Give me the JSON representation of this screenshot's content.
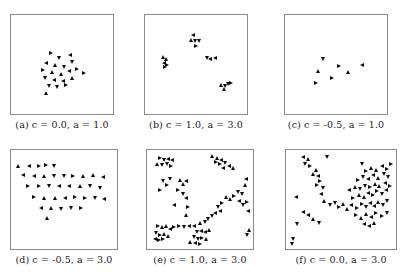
{
  "figure": {
    "marker_color": "#0b0b0b",
    "frame_color": "#8a8a8a",
    "background": "#ffffff",
    "rows": 2,
    "cols": 3
  },
  "panels": [
    {
      "tag": "(a)",
      "caption": "(a) c = 0.0, a = 1.0",
      "c": "0.0",
      "a": "1.0",
      "n_points": 21
    },
    {
      "tag": "(b)",
      "caption": "(b) c = 1.0, a = 3.0",
      "c": "1.0",
      "a": "3.0",
      "n_points": 18
    },
    {
      "tag": "(c)",
      "caption": "(c) c = -0.5, a = 1.0",
      "c": "-0.5",
      "a": "1.0",
      "n_points": 7
    },
    {
      "tag": "(d)",
      "caption": "(d) c = -0.5, a = 3.0",
      "c": "-0.5",
      "a": "3.0",
      "n_points": 43
    },
    {
      "tag": "(e)",
      "caption": "(e) c = 1.0, a = 3.0",
      "c": "1.0",
      "a": "3.0",
      "n_points": 78
    },
    {
      "tag": "(f)",
      "caption": "(f) c = 0.0, a = 3.0",
      "c": "0.0",
      "a": "3.0",
      "n_points": 76
    }
  ],
  "chart_data": [
    {
      "type": "scatter",
      "title": "(a) c = 0.0, a = 1.0",
      "xlabel": "",
      "ylabel": "",
      "xlim": [
        0,
        1
      ],
      "ylim": [
        0,
        1
      ],
      "grid": false,
      "legend": false,
      "marker": "triangle",
      "points": [
        [
          0.39,
          0.62
        ],
        [
          0.47,
          0.57
        ],
        [
          0.58,
          0.6
        ],
        [
          0.33,
          0.52
        ],
        [
          0.43,
          0.5
        ],
        [
          0.52,
          0.47
        ],
        [
          0.6,
          0.53
        ],
        [
          0.3,
          0.44
        ],
        [
          0.4,
          0.42
        ],
        [
          0.49,
          0.4
        ],
        [
          0.57,
          0.43
        ],
        [
          0.66,
          0.45
        ],
        [
          0.73,
          0.41
        ],
        [
          0.32,
          0.35
        ],
        [
          0.42,
          0.33
        ],
        [
          0.51,
          0.32
        ],
        [
          0.6,
          0.35
        ],
        [
          0.36,
          0.27
        ],
        [
          0.45,
          0.26
        ],
        [
          0.54,
          0.28
        ],
        [
          0.33,
          0.19
        ]
      ]
    },
    {
      "type": "scatter",
      "title": "(b) c = 1.0, a = 3.0",
      "xlabel": "",
      "ylabel": "",
      "xlim": [
        0,
        1
      ],
      "ylim": [
        0,
        1
      ],
      "grid": false,
      "legend": false,
      "marker": "triangle",
      "points": [
        [
          0.47,
          0.82
        ],
        [
          0.45,
          0.76
        ],
        [
          0.49,
          0.75
        ],
        [
          0.53,
          0.75
        ],
        [
          0.5,
          0.7
        ],
        [
          0.16,
          0.58
        ],
        [
          0.19,
          0.56
        ],
        [
          0.17,
          0.52
        ],
        [
          0.2,
          0.5
        ],
        [
          0.18,
          0.47
        ],
        [
          0.61,
          0.57
        ],
        [
          0.65,
          0.56
        ],
        [
          0.7,
          0.57
        ],
        [
          0.76,
          0.28
        ],
        [
          0.8,
          0.27
        ],
        [
          0.83,
          0.29
        ],
        [
          0.86,
          0.3
        ],
        [
          0.79,
          0.24
        ]
      ]
    },
    {
      "type": "scatter",
      "title": "(c) c = -0.5, a = 1.0",
      "xlabel": "",
      "ylabel": "",
      "xlim": [
        0,
        1
      ],
      "ylim": [
        0,
        1
      ],
      "grid": false,
      "legend": false,
      "marker": "triangle",
      "points": [
        [
          0.36,
          0.56
        ],
        [
          0.53,
          0.48
        ],
        [
          0.31,
          0.43
        ],
        [
          0.63,
          0.42
        ],
        [
          0.77,
          0.5
        ],
        [
          0.46,
          0.36
        ],
        [
          0.29,
          0.3
        ]
      ]
    },
    {
      "type": "scatter",
      "title": "(d) c = -0.5, a = 3.0",
      "xlabel": "",
      "ylabel": "",
      "xlim": [
        0,
        1
      ],
      "ylim": [
        0,
        1
      ],
      "grid": false,
      "legend": false,
      "marker": "triangle",
      "points": [
        [
          0.04,
          0.86
        ],
        [
          0.15,
          0.86
        ],
        [
          0.25,
          0.86
        ],
        [
          0.32,
          0.87
        ],
        [
          0.4,
          0.86
        ],
        [
          0.09,
          0.76
        ],
        [
          0.2,
          0.75
        ],
        [
          0.3,
          0.75
        ],
        [
          0.4,
          0.75
        ],
        [
          0.5,
          0.75
        ],
        [
          0.59,
          0.75
        ],
        [
          0.69,
          0.75
        ],
        [
          0.79,
          0.76
        ],
        [
          0.89,
          0.74
        ],
        [
          0.14,
          0.65
        ],
        [
          0.25,
          0.64
        ],
        [
          0.35,
          0.64
        ],
        [
          0.45,
          0.64
        ],
        [
          0.55,
          0.64
        ],
        [
          0.66,
          0.64
        ],
        [
          0.76,
          0.64
        ],
        [
          0.86,
          0.62
        ],
        [
          0.2,
          0.53
        ],
        [
          0.3,
          0.52
        ],
        [
          0.41,
          0.52
        ],
        [
          0.51,
          0.52
        ],
        [
          0.61,
          0.53
        ],
        [
          0.71,
          0.52
        ],
        [
          0.81,
          0.52
        ],
        [
          0.9,
          0.51
        ],
        [
          0.27,
          0.41
        ],
        [
          0.37,
          0.41
        ],
        [
          0.47,
          0.4
        ],
        [
          0.57,
          0.41
        ],
        [
          0.67,
          0.41
        ],
        [
          0.33,
          0.3
        ]
      ]
    },
    {
      "type": "scatter",
      "title": "(e) c = 1.0, a = 3.0",
      "xlabel": "",
      "ylabel": "",
      "xlim": [
        0,
        1
      ],
      "ylim": [
        0,
        1
      ],
      "grid": false,
      "legend": false,
      "marker": "triangle",
      "points": [
        [
          0.1,
          0.95
        ],
        [
          0.14,
          0.93
        ],
        [
          0.18,
          0.94
        ],
        [
          0.22,
          0.92
        ],
        [
          0.07,
          0.88
        ],
        [
          0.12,
          0.87
        ],
        [
          0.17,
          0.88
        ],
        [
          0.21,
          0.86
        ],
        [
          0.62,
          0.97
        ],
        [
          0.67,
          0.95
        ],
        [
          0.71,
          0.93
        ],
        [
          0.66,
          0.9
        ],
        [
          0.7,
          0.88
        ],
        [
          0.75,
          0.89
        ],
        [
          0.79,
          0.86
        ],
        [
          0.73,
          0.84
        ],
        [
          0.83,
          0.84
        ],
        [
          0.13,
          0.7
        ],
        [
          0.2,
          0.72
        ],
        [
          0.17,
          0.66
        ],
        [
          0.3,
          0.71
        ],
        [
          0.33,
          0.67
        ],
        [
          0.36,
          0.7
        ],
        [
          0.1,
          0.6
        ],
        [
          0.28,
          0.6
        ],
        [
          0.33,
          0.56
        ],
        [
          0.36,
          0.52
        ],
        [
          0.96,
          0.72
        ],
        [
          0.95,
          0.66
        ],
        [
          0.88,
          0.58
        ],
        [
          0.92,
          0.56
        ],
        [
          0.84,
          0.54
        ],
        [
          0.8,
          0.51
        ],
        [
          0.76,
          0.53
        ],
        [
          0.24,
          0.44
        ],
        [
          0.38,
          0.42
        ],
        [
          0.72,
          0.46
        ],
        [
          0.68,
          0.42
        ],
        [
          0.7,
          0.38
        ],
        [
          0.65,
          0.36
        ],
        [
          0.36,
          0.33
        ],
        [
          0.62,
          0.32
        ],
        [
          0.58,
          0.29
        ],
        [
          0.08,
          0.22
        ],
        [
          0.12,
          0.2
        ],
        [
          0.16,
          0.21
        ],
        [
          0.2,
          0.18
        ],
        [
          0.24,
          0.2
        ],
        [
          0.29,
          0.21
        ],
        [
          0.34,
          0.2
        ],
        [
          0.39,
          0.22
        ],
        [
          0.44,
          0.21
        ],
        [
          0.5,
          0.25
        ],
        [
          0.55,
          0.26
        ],
        [
          0.06,
          0.14
        ],
        [
          0.1,
          0.12
        ],
        [
          0.14,
          0.13
        ],
        [
          0.18,
          0.11
        ],
        [
          0.05,
          0.08
        ],
        [
          0.09,
          0.06
        ],
        [
          0.13,
          0.07
        ],
        [
          0.47,
          0.15
        ],
        [
          0.51,
          0.16
        ],
        [
          0.55,
          0.15
        ],
        [
          0.59,
          0.17
        ],
        [
          0.44,
          0.1
        ],
        [
          0.48,
          0.08
        ],
        [
          0.52,
          0.09
        ],
        [
          0.56,
          0.07
        ],
        [
          0.4,
          0.04
        ],
        [
          0.45,
          0.03
        ],
        [
          0.5,
          0.02
        ],
        [
          0.97,
          0.47
        ],
        [
          0.93,
          0.44
        ],
        [
          0.89,
          0.48
        ],
        [
          0.98,
          0.38
        ],
        [
          0.99,
          0.17
        ],
        [
          0.97,
          0.12
        ]
      ]
    },
    {
      "type": "scatter",
      "title": "(f) c = 0.0, a = 3.0",
      "xlabel": "",
      "ylabel": "",
      "xlim": [
        0,
        1
      ],
      "ylim": [
        0,
        1
      ],
      "grid": false,
      "legend": false,
      "marker": "triangle",
      "points": [
        [
          0.13,
          0.96
        ],
        [
          0.18,
          0.94
        ],
        [
          0.37,
          0.96
        ],
        [
          0.15,
          0.88
        ],
        [
          0.2,
          0.86
        ],
        [
          0.26,
          0.82
        ],
        [
          0.23,
          0.77
        ],
        [
          0.28,
          0.75
        ],
        [
          0.3,
          0.7
        ],
        [
          0.27,
          0.66
        ],
        [
          0.33,
          0.62
        ],
        [
          0.31,
          0.56
        ],
        [
          0.07,
          0.53
        ],
        [
          0.34,
          0.48
        ],
        [
          0.39,
          0.44
        ],
        [
          0.44,
          0.46
        ],
        [
          0.48,
          0.42
        ],
        [
          0.52,
          0.45
        ],
        [
          0.56,
          0.4
        ],
        [
          0.6,
          0.44
        ],
        [
          0.65,
          0.41
        ],
        [
          0.7,
          0.45
        ],
        [
          0.74,
          0.42
        ],
        [
          0.78,
          0.46
        ],
        [
          0.82,
          0.43
        ],
        [
          0.86,
          0.47
        ],
        [
          0.9,
          0.44
        ],
        [
          0.94,
          0.48
        ],
        [
          0.62,
          0.52
        ],
        [
          0.67,
          0.55
        ],
        [
          0.72,
          0.53
        ],
        [
          0.76,
          0.57
        ],
        [
          0.81,
          0.55
        ],
        [
          0.85,
          0.59
        ],
        [
          0.89,
          0.56
        ],
        [
          0.93,
          0.6
        ],
        [
          0.58,
          0.6
        ],
        [
          0.63,
          0.63
        ],
        [
          0.68,
          0.61
        ],
        [
          0.73,
          0.65
        ],
        [
          0.78,
          0.63
        ],
        [
          0.83,
          0.67
        ],
        [
          0.87,
          0.64
        ],
        [
          0.92,
          0.68
        ],
        [
          0.97,
          0.65
        ],
        [
          0.66,
          0.71
        ],
        [
          0.71,
          0.74
        ],
        [
          0.76,
          0.72
        ],
        [
          0.81,
          0.76
        ],
        [
          0.86,
          0.73
        ],
        [
          0.91,
          0.77
        ],
        [
          0.95,
          0.74
        ],
        [
          0.74,
          0.81
        ],
        [
          0.79,
          0.84
        ],
        [
          0.84,
          0.82
        ],
        [
          0.89,
          0.86
        ],
        [
          0.94,
          0.83
        ],
        [
          0.98,
          0.88
        ],
        [
          0.7,
          0.88
        ],
        [
          0.13,
          0.37
        ],
        [
          0.18,
          0.33
        ],
        [
          0.23,
          0.29
        ],
        [
          0.08,
          0.24
        ],
        [
          0.29,
          0.25
        ],
        [
          0.64,
          0.33
        ],
        [
          0.69,
          0.3
        ],
        [
          0.74,
          0.34
        ],
        [
          0.79,
          0.31
        ],
        [
          0.84,
          0.35
        ],
        [
          0.89,
          0.32
        ],
        [
          0.94,
          0.36
        ],
        [
          0.72,
          0.24
        ],
        [
          0.77,
          0.21
        ],
        [
          0.82,
          0.25
        ],
        [
          0.04,
          0.08
        ],
        [
          0.03,
          0.02
        ]
      ]
    }
  ]
}
